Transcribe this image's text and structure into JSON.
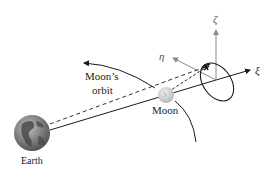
{
  "labels": {
    "earth": "Earth",
    "moon": "Moon",
    "moon_orbit_line1": "Moon’s",
    "moon_orbit_line2": "orbit",
    "xi": "ξ",
    "eta": "η",
    "zeta": "ζ"
  },
  "colors": {
    "line": "#1a1a1a",
    "axis_gray": "#8a8a8a",
    "earth_ocean": "#7d7d7d",
    "earth_land": "#4a4a4a",
    "moon": "#cfcfcf"
  }
}
